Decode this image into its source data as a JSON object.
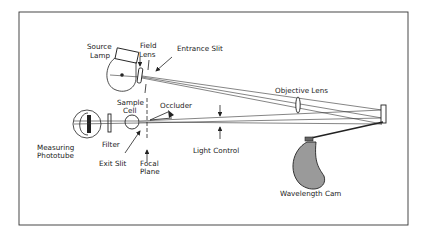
{
  "diagram": {
    "labels": {
      "source_lamp_1": "Source",
      "source_lamp_2": "Lamp",
      "field_lens_1": "Field",
      "field_lens_2": "Lens",
      "entrance_slit": "Entrance Slit",
      "objective_lens": "Objective Lens",
      "sample_cell_1": "Sample",
      "sample_cell_2": "Cell",
      "occluder": "Occluder",
      "measuring_phototube_1": "Measuring",
      "measuring_phototube_2": "Phototube",
      "filter": "Filter",
      "exit_slit": "Exit Slit",
      "focal_plane_1": "Focal",
      "focal_plane_2": "Plane",
      "light_control": "Light Control",
      "wavelength_cam": "Wavelength Cam"
    },
    "colors": {
      "line": "#222222",
      "cam_fill": "#9a9a9a",
      "background": "#ffffff"
    }
  }
}
